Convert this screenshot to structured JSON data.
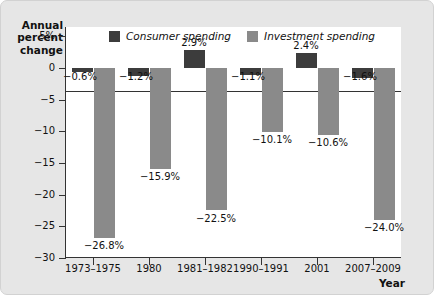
{
  "axes": {
    "ylabel": "Annual\npercent\nchange",
    "xlabel": "Year",
    "yticks": [
      "5%",
      "0",
      "−5",
      "−10",
      "−15",
      "−20",
      "−25",
      "−30"
    ],
    "ytick_values": [
      5,
      0,
      -5,
      -10,
      -15,
      -20,
      -25,
      -30
    ],
    "ylim": [
      -30,
      6.5
    ]
  },
  "legend": {
    "items": [
      {
        "label": "Consumer spending",
        "color": "#3c3c3c",
        "key": "consumer"
      },
      {
        "label": "Investment spending",
        "color": "#8a8a8a",
        "key": "investment"
      }
    ]
  },
  "chart_data": {
    "type": "bar",
    "title": "",
    "xlabel": "Year",
    "ylabel": "Annual percent change",
    "ylim": [
      -30,
      6.5
    ],
    "grid": false,
    "legend_position": "top-center",
    "categories": [
      "1973–1975",
      "1980",
      "1981–1982",
      "1990–1991",
      "2001",
      "2007–2009"
    ],
    "series": [
      {
        "name": "Consumer spending",
        "color": "#3c3c3c",
        "values": [
          -0.6,
          -1.2,
          2.9,
          -1.1,
          2.4,
          -1.6
        ],
        "labels": [
          "−0.6%",
          "−1.2%",
          "2.9%",
          "−1.1%",
          "2.4%",
          "−1.6%"
        ]
      },
      {
        "name": "Investment spending",
        "color": "#8a8a8a",
        "values": [
          -26.8,
          -15.9,
          -22.5,
          -10.1,
          -10.6,
          -24.0
        ],
        "labels": [
          "−26.8%",
          "−15.9%",
          "−22.5%",
          "−10.1%",
          "−10.6%",
          "−24.0%"
        ]
      }
    ]
  }
}
